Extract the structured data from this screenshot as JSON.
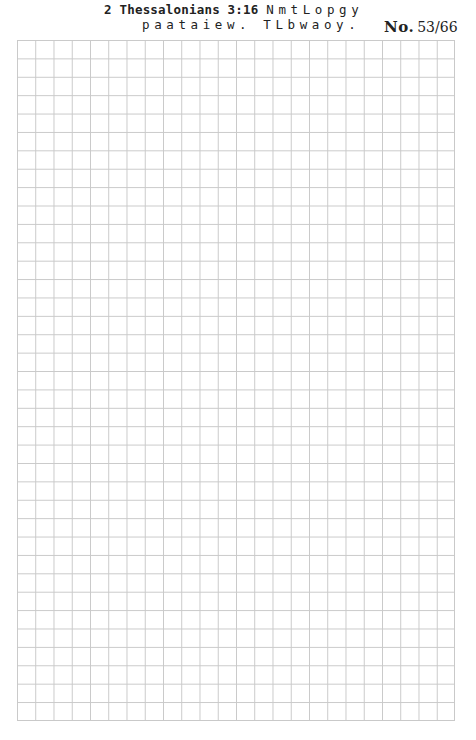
{
  "header": {
    "reference": "2 Thessalonians 3:16",
    "cipher_line1": "NmtLopgy",
    "cipher_line2": "paataiew. TLbwaoy.",
    "page_label": "No.",
    "page_number": "53/66"
  },
  "grid": {
    "columns": 24,
    "rows": 37,
    "line_color": "#c9c9c9"
  }
}
